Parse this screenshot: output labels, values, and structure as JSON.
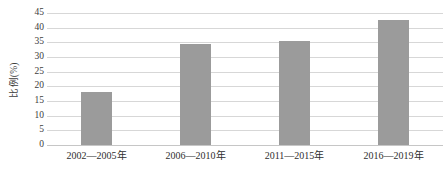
{
  "chart_data": {
    "type": "bar",
    "title": "",
    "subtitle": "",
    "xlabel": "",
    "ylabel": "比例(%)",
    "categories": [
      "2002—2005年",
      "2006—2010年",
      "2011—2015年",
      "2016—2019年"
    ],
    "values": [
      18.0,
      34.5,
      35.5,
      42.7
    ],
    "series": [
      {
        "name": "比例(%)",
        "values": [
          18.0,
          34.5,
          35.5,
          42.7
        ]
      }
    ],
    "ylim": [
      0,
      45
    ],
    "ytick_step": 5,
    "ytick_labels": [
      "0",
      "5",
      "10",
      "15",
      "20",
      "25",
      "30",
      "35",
      "40",
      "45"
    ],
    "ytick_values": [
      0,
      5,
      10,
      15,
      20,
      25,
      30,
      35,
      40,
      45
    ],
    "grid": true,
    "grid_axis": "y",
    "legend": false,
    "legend_position": "none",
    "data_labels": false,
    "annotations": [],
    "colors": {
      "bar_fill": "#9b9b9b",
      "gridline": "#d7d7d7",
      "axis_line": "#c6c6c6",
      "background": "#ffffff",
      "text": "#3d3d3d"
    }
  }
}
